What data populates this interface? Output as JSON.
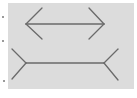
{
  "figure": {
    "name": "Müller-Lyer illusion",
    "background_color": "#dcdcdc",
    "stroke_color": "#6a6a6a",
    "top_figure": {
      "type": "arrowheads-inward",
      "shaft": {
        "x1": 26,
        "y1": 24,
        "x2": 104,
        "y2": 24
      },
      "fins": [
        {
          "x1": 26,
          "y1": 24,
          "x2": 42,
          "y2": 8
        },
        {
          "x1": 26,
          "y1": 24,
          "x2": 42,
          "y2": 39
        },
        {
          "x1": 104,
          "y1": 24,
          "x2": 89,
          "y2": 8
        },
        {
          "x1": 104,
          "y1": 24,
          "x2": 89,
          "y2": 39
        }
      ]
    },
    "bottom_figure": {
      "type": "arrowheads-outward",
      "shaft": {
        "x1": 26,
        "y1": 63,
        "x2": 104,
        "y2": 63
      },
      "fins": [
        {
          "x1": 26,
          "y1": 63,
          "x2": 12,
          "y2": 49
        },
        {
          "x1": 26,
          "y1": 63,
          "x2": 12,
          "y2": 79
        },
        {
          "x1": 104,
          "y1": 63,
          "x2": 118,
          "y2": 49
        },
        {
          "x1": 104,
          "y1": 63,
          "x2": 118,
          "y2": 80
        }
      ]
    }
  }
}
